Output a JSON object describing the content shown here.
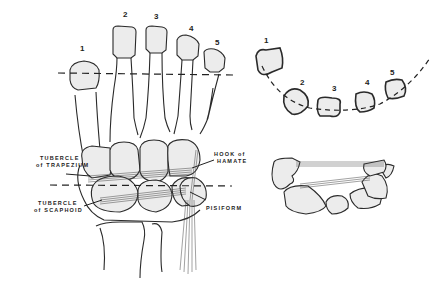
{
  "diagram": {
    "type": "anatomical illustration",
    "colors": {
      "bone_fill": "#ececec",
      "line": "#2a2a2a",
      "background": "#ffffff"
    }
  },
  "main_view": {
    "metacarpal_numbers": [
      "1",
      "2",
      "3",
      "4",
      "5"
    ],
    "labels": {
      "tubercle_trapezium_line1": "TUBERCLE",
      "tubercle_trapezium_line2": "of TRAPEZIUM",
      "tubercle_scaphoid_line1": "TUBERCLE",
      "tubercle_scaphoid_line2": "of SCAPHOID",
      "hook_hamate_line1": "HOOK of",
      "hook_hamate_line2": "HAMATE",
      "pisiform": "PISIFORM"
    }
  },
  "upper_section": {
    "numbers": [
      "1",
      "2",
      "3",
      "4",
      "5"
    ]
  }
}
